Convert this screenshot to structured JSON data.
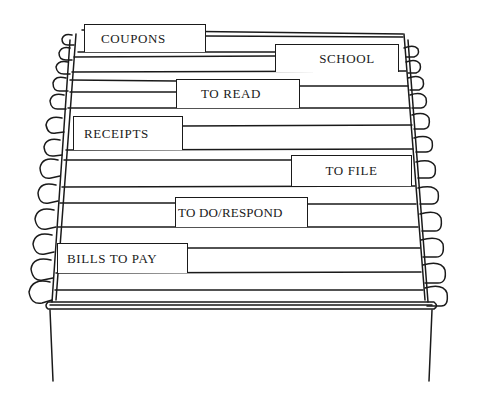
{
  "illustration": {
    "subject": "hanging file folder box",
    "line_color": "#1a1a1a",
    "background": "#ffffff"
  },
  "tabs": [
    {
      "label": "COUPONS",
      "x": 84,
      "y": 24,
      "w": 122,
      "h": 28,
      "pad": 16,
      "align": "left"
    },
    {
      "label": "SCHOOL",
      "x": 275,
      "y": 44,
      "w": 124,
      "h": 28,
      "pad": 0,
      "align": "center-right"
    },
    {
      "label": "TO READ",
      "x": 176,
      "y": 79,
      "w": 124,
      "h": 29,
      "pad": 24,
      "align": "left"
    },
    {
      "label": "RECEIPTS",
      "x": 73,
      "y": 116,
      "w": 110,
      "h": 34,
      "pad": 10,
      "align": "left"
    },
    {
      "label": "TO FILE",
      "x": 291,
      "y": 155,
      "w": 121,
      "h": 31,
      "pad": 0,
      "align": "center"
    },
    {
      "label": "TO DO/RESPOND",
      "x": 175,
      "y": 197,
      "w": 133,
      "h": 30,
      "pad": 2,
      "align": "left"
    },
    {
      "label": "BILLS TO PAY",
      "x": 57,
      "y": 243,
      "w": 131,
      "h": 30,
      "pad": 9,
      "align": "left"
    }
  ]
}
